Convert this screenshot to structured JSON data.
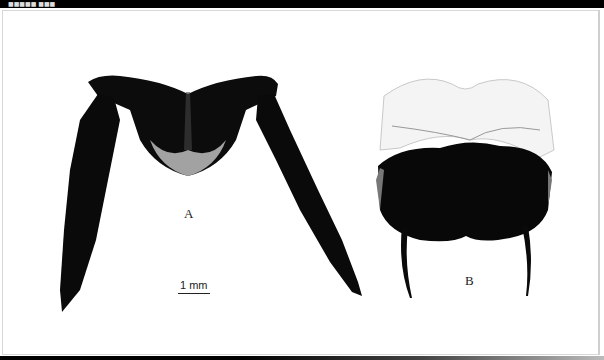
{
  "header": {
    "caption": "■■■■■ ■■■"
  },
  "figure": {
    "panels": [
      {
        "id": "A",
        "label": "A",
        "description": "Dark sclerotized plate with two long serrated lateral lobes"
      },
      {
        "id": "B",
        "label": "B",
        "description": "Rounded bilobed dark structure with pale upper membrane and two curved processes"
      }
    ],
    "scale_bar": {
      "text": "1 mm"
    }
  },
  "colors": {
    "specimen": "#0a0a0a",
    "background": "#ffffff",
    "bar": "#000000"
  }
}
